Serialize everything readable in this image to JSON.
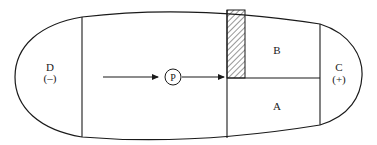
{
  "diagram": {
    "type": "capsule-compartment-diagram",
    "regions": {
      "left_end": {
        "label": "D",
        "sign": "(–)"
      },
      "right_end": {
        "label": "C",
        "sign": "(+)"
      },
      "upper_right": {
        "label": "B"
      },
      "lower_right": {
        "label": "A"
      }
    },
    "particle": {
      "label": "P"
    },
    "arrows": [
      {
        "from": "middle-chamber",
        "to": "particle-P",
        "direction": "right"
      },
      {
        "from": "particle-P",
        "to": "hatched-barrier",
        "direction": "right"
      }
    ],
    "barrier": {
      "style": "hatched"
    },
    "colors": {
      "stroke": "#1a1a1a",
      "background": "#ffffff"
    }
  }
}
